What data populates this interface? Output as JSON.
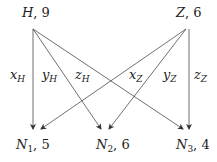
{
  "sources": [
    {
      "id": "H",
      "name": "H",
      "value": "9",
      "label": "H, 9"
    },
    {
      "id": "Z",
      "name": "Z",
      "value": "6",
      "label": "Z, 6"
    }
  ],
  "targets": [
    {
      "id": "N1",
      "name": "N",
      "sub": "1",
      "value": "5",
      "label": "N1, 5"
    },
    {
      "id": "N2",
      "name": "N",
      "sub": "2",
      "value": "6",
      "label": "N2, 6"
    },
    {
      "id": "N3",
      "name": "N",
      "sub": "3",
      "value": "4",
      "label": "N3, 4"
    }
  ],
  "edges": [
    {
      "from": "H",
      "to": "N1",
      "var": "x",
      "sub": "H"
    },
    {
      "from": "H",
      "to": "N2",
      "var": "y",
      "sub": "H"
    },
    {
      "from": "H",
      "to": "N3",
      "var": "z",
      "sub": "H"
    },
    {
      "from": "Z",
      "to": "N1",
      "var": "x",
      "sub": "Z"
    },
    {
      "from": "Z",
      "to": "N2",
      "var": "y",
      "sub": "Z"
    },
    {
      "from": "Z",
      "to": "N3",
      "var": "z",
      "sub": "Z"
    }
  ],
  "colors": {
    "line": "#333333",
    "text": "#222222"
  }
}
